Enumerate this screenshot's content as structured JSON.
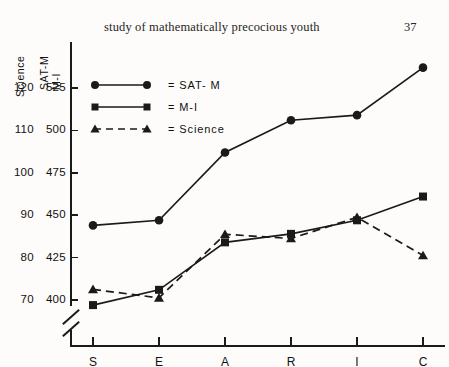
{
  "header": {
    "running_head": "study of mathematically precocious youth",
    "page_number": "37"
  },
  "axis_titles": {
    "science": "Science",
    "satm": "SAT-M",
    "mi": "M-I"
  },
  "legend": {
    "satm": "= SAT- M",
    "mi": "= M-I",
    "science": "= Science"
  },
  "chart_data": {
    "type": "line",
    "title": "",
    "xlabel": "",
    "ylabel": "SAT-M / M-I",
    "categories": [
      "S",
      "E",
      "A",
      "R",
      "I",
      "C"
    ],
    "grid": false,
    "legend_position": "top-left",
    "axis_break": true,
    "y_axes": [
      {
        "name": "Science",
        "ticks": [
          120,
          110,
          100,
          90,
          80,
          70
        ],
        "tick_labels": [
          "120",
          "110",
          "100",
          "90",
          "80",
          "70"
        ],
        "ylim": [
          70,
          120
        ]
      },
      {
        "name": "SAT-M / M-I",
        "ticks": [
          525,
          500,
          475,
          450,
          425,
          400
        ],
        "tick_labels": [
          "525",
          "500",
          "475",
          "450",
          "425",
          "400"
        ],
        "ylim": [
          400,
          525
        ]
      }
    ],
    "series": [
      {
        "name": "SAT-M",
        "marker": "circle",
        "line": "solid",
        "scale": "SAT-M / M-I",
        "values": [
          444,
          447,
          487,
          506,
          509,
          537
        ]
      },
      {
        "name": "M-I",
        "marker": "square",
        "line": "solid",
        "scale": "SAT-M / M-I",
        "values": [
          397,
          406,
          434,
          439,
          447,
          461
        ]
      },
      {
        "name": "Science",
        "marker": "triangle",
        "line": "dashed",
        "scale": "Science",
        "values": [
          72.5,
          70.5,
          85.5,
          84.5,
          89.5,
          80.5
        ]
      }
    ]
  }
}
